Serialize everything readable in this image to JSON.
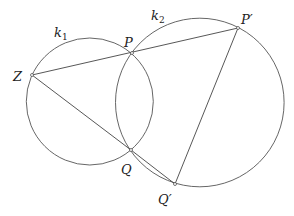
{
  "figure": {
    "circles": [
      {
        "id": "k1",
        "label": "k",
        "subscript": "1",
        "cx": 89.8,
        "cy": 101.5,
        "r": 63.5,
        "label_x": 54,
        "label_y": 37
      },
      {
        "id": "k2",
        "label": "k",
        "subscript": "2",
        "cx": 199.8,
        "cy": 102.5,
        "r": 84.3,
        "label_x": 151,
        "label_y": 20
      }
    ],
    "points": [
      {
        "id": "Z",
        "label": "Z",
        "x": 32,
        "y": 75,
        "label_x": 13,
        "label_y": 81
      },
      {
        "id": "P",
        "label": "P",
        "x": 132,
        "y": 53,
        "label_x": 124,
        "label_y": 47
      },
      {
        "id": "P_prime",
        "label": "P′",
        "x": 238,
        "y": 28,
        "label_x": 241,
        "label_y": 24
      },
      {
        "id": "Q",
        "label": "Q",
        "x": 131,
        "y": 150,
        "label_x": 121,
        "label_y": 174
      },
      {
        "id": "Q_prime",
        "label": "Q′",
        "x": 175,
        "y": 184,
        "label_x": 158,
        "label_y": 204
      }
    ],
    "segments": [
      {
        "from": "Z",
        "to": "P_prime"
      },
      {
        "from": "Z",
        "to": "Q"
      },
      {
        "from": "Q",
        "to": "Q_prime"
      },
      {
        "from": "P_prime",
        "to": "Q_prime"
      }
    ]
  }
}
